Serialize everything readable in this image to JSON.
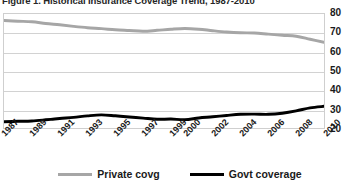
{
  "chart_data": {
    "type": "line",
    "title": "Figure 1. Historical Insurance Coverage Trend, 1987-2010",
    "xlabel": "",
    "ylabel": "",
    "ylim": [
      20,
      80
    ],
    "yticks": [
      80,
      70,
      60,
      50,
      40,
      30,
      20
    ],
    "grid": true,
    "legend_position": "bottom-center",
    "categories": [
      "1987",
      "1988",
      "1989",
      "1990",
      "1991",
      "1992",
      "1993",
      "1994",
      "1995",
      "1996",
      "1997",
      "1998",
      "1999",
      "2000",
      "2001",
      "2002",
      "2003",
      "2004",
      "2005",
      "2006",
      "2007",
      "2008",
      "2009",
      "2010"
    ],
    "xticklabels": [
      "1987",
      "1989",
      "1991",
      "1993",
      "1995",
      "1997",
      "1999",
      "2000",
      "2002",
      "2004",
      "2006",
      "2008",
      "2010"
    ],
    "series": [
      {
        "name": "Private covg",
        "color": "#a6a6a6",
        "values": [
          76.6,
          76.2,
          75.9,
          75.0,
          74.3,
          73.5,
          72.8,
          72.3,
          71.7,
          71.3,
          70.9,
          71.4,
          72.0,
          72.4,
          72.0,
          71.2,
          70.5,
          70.1,
          70.0,
          69.4,
          68.8,
          68.3,
          66.7,
          65.1
        ]
      },
      {
        "name": "Govt coverage",
        "color": "#000000",
        "values": [
          23.3,
          23.5,
          23.7,
          24.3,
          25.0,
          25.6,
          26.4,
          26.9,
          26.4,
          25.8,
          25.2,
          24.6,
          24.7,
          24.4,
          25.3,
          25.9,
          26.6,
          27.2,
          27.3,
          27.2,
          27.8,
          29.0,
          30.6,
          31.4
        ]
      }
    ]
  },
  "legend": {
    "items": [
      {
        "label": "Private covg",
        "color": "#a6a6a6"
      },
      {
        "label": "Govt coverage",
        "color": "#000000"
      }
    ]
  }
}
